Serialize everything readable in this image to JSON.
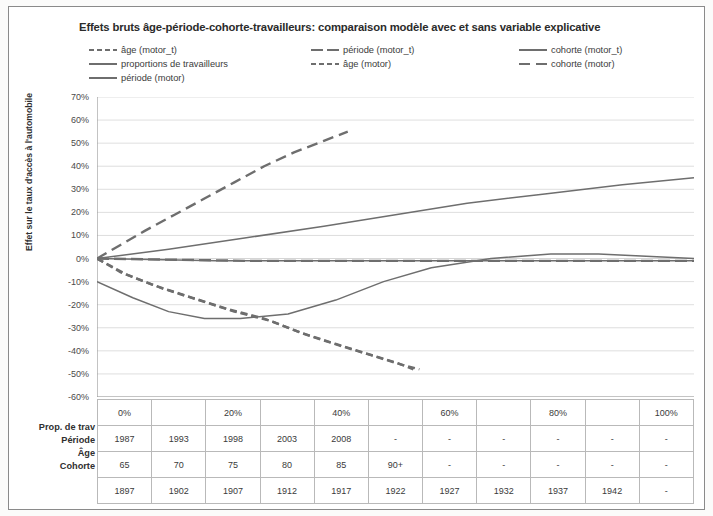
{
  "chart_data": {
    "type": "line",
    "title": "Effets bruts âge-période-cohorte-travailleurs: comparaison modèle avec et sans variable explicative",
    "xlabel": "",
    "ylabel": "Effet sur le taux d'accès à l'automobile",
    "ylim": [
      -60,
      70
    ],
    "ytick_labels": [
      "70%",
      "60%",
      "50%",
      "40%",
      "30%",
      "20%",
      "10%",
      "0%",
      "-10%",
      "-20%",
      "-30%",
      "-40%",
      "-50%",
      "-60%"
    ],
    "ytick_values": [
      70,
      60,
      50,
      40,
      30,
      20,
      10,
      0,
      -10,
      -20,
      -30,
      -40,
      -50,
      -60
    ],
    "xtick_labels": [
      "0%",
      "20%",
      "40%",
      "60%",
      "80%",
      "100%"
    ],
    "xtick_values": [
      0,
      20,
      40,
      60,
      80,
      100
    ],
    "grid": true,
    "legend_position": "top",
    "series": [
      {
        "name": "âge (motor_t)",
        "style": "dashed",
        "color": "#6e6e6e",
        "points": [
          [
            0,
            0
          ],
          [
            4,
            -6
          ],
          [
            10,
            -12
          ],
          [
            16,
            -17
          ],
          [
            22,
            -22
          ],
          [
            28,
            -26
          ],
          [
            34,
            -32
          ],
          [
            40,
            -37
          ],
          [
            45,
            -41
          ],
          [
            50,
            -45
          ],
          [
            53,
            -48
          ]
        ]
      },
      {
        "name": "proportions de travailleurs",
        "style": "solid",
        "color": "#6e6e6e",
        "points": [
          [
            0,
            -10
          ],
          [
            6,
            -17
          ],
          [
            12,
            -23
          ],
          [
            18,
            -26
          ],
          [
            24,
            -26
          ],
          [
            32,
            -24
          ],
          [
            40,
            -18
          ],
          [
            48,
            -10
          ],
          [
            56,
            -4
          ],
          [
            66,
            0
          ],
          [
            76,
            2
          ],
          [
            84,
            2
          ],
          [
            92,
            1
          ],
          [
            100,
            0
          ]
        ]
      },
      {
        "name": "période (motor)",
        "style": "solid",
        "color": "#6e6e6e",
        "points": [
          [
            0,
            0
          ],
          [
            20,
            -1
          ],
          [
            40,
            -1
          ],
          [
            60,
            -1
          ],
          [
            80,
            -1
          ],
          [
            100,
            -1
          ]
        ]
      },
      {
        "name": "période (motor_t)",
        "style": "dash-dash",
        "color": "#6e6e6e",
        "points": [
          [
            0,
            0
          ],
          [
            25,
            -1
          ],
          [
            50,
            -1
          ],
          [
            75,
            -1
          ],
          [
            100,
            -1
          ]
        ]
      },
      {
        "name": "âge (motor)",
        "style": "dashed",
        "color": "#6e6e6e",
        "points": [
          [
            0,
            0
          ],
          [
            5,
            -7
          ],
          [
            11,
            -13
          ],
          [
            17,
            -18
          ],
          [
            23,
            -23
          ],
          [
            29,
            -27
          ],
          [
            35,
            -33
          ],
          [
            41,
            -38
          ],
          [
            46,
            -42
          ],
          [
            51,
            -46
          ],
          [
            54,
            -48
          ]
        ]
      },
      {
        "name": "cohorte (motor_t)",
        "style": "solid",
        "color": "#6e6e6e",
        "points": [
          [
            0,
            0
          ],
          [
            12,
            4
          ],
          [
            25,
            9
          ],
          [
            38,
            14
          ],
          [
            50,
            19
          ],
          [
            62,
            24
          ],
          [
            75,
            28
          ],
          [
            88,
            32
          ],
          [
            100,
            35
          ]
        ]
      },
      {
        "name": "cohorte (motor)",
        "style": "long-dashed",
        "color": "#6e6e6e",
        "points": [
          [
            0,
            0
          ],
          [
            4,
            6
          ],
          [
            8,
            12
          ],
          [
            13,
            19
          ],
          [
            18,
            26
          ],
          [
            23,
            33
          ],
          [
            28,
            40
          ],
          [
            33,
            46
          ],
          [
            38,
            51
          ],
          [
            42,
            55
          ]
        ]
      }
    ]
  },
  "legend": {
    "items": [
      {
        "label": "âge (motor_t)",
        "style": "dashed",
        "col": 0,
        "row": 0
      },
      {
        "label": "proportions de travailleurs",
        "style": "solid",
        "col": 0,
        "row": 1
      },
      {
        "label": "période (motor)",
        "style": "solid",
        "col": 0,
        "row": 2
      },
      {
        "label": "période (motor_t)",
        "style": "dash-dash",
        "col": 1,
        "row": 0
      },
      {
        "label": "âge (motor)",
        "style": "dashed",
        "col": 1,
        "row": 1
      },
      {
        "label": "cohorte (motor_t)",
        "style": "solid",
        "col": 2,
        "row": 0
      },
      {
        "label": "cohorte (motor)",
        "style": "long-dashed",
        "col": 2,
        "row": 1
      }
    ]
  },
  "table": {
    "row_labels": [
      "Prop. de trav",
      "Période",
      "Âge",
      "Cohorte"
    ],
    "header_row": [
      "0%",
      "",
      "20%",
      "",
      "40%",
      "",
      "60%",
      "",
      "80%",
      "",
      "100%"
    ],
    "rows": [
      {
        "name": "Période",
        "cells": [
          "1987",
          "1993",
          "1998",
          "2003",
          "2008",
          "-",
          "-",
          "-",
          "-",
          "-",
          "-"
        ]
      },
      {
        "name": "Âge",
        "cells": [
          "65",
          "70",
          "75",
          "80",
          "85",
          "90+",
          "-",
          "-",
          "-",
          "-",
          "-"
        ]
      },
      {
        "name": "Cohorte",
        "cells": [
          "1897",
          "1902",
          "1907",
          "1912",
          "1917",
          "1922",
          "1927",
          "1932",
          "1937",
          "1942",
          "-"
        ]
      }
    ]
  },
  "colors": {
    "line": "#6e6e6e",
    "grid": "#d5d5d5",
    "axis": "#9a9a9a",
    "text": "#3a3a3a"
  }
}
